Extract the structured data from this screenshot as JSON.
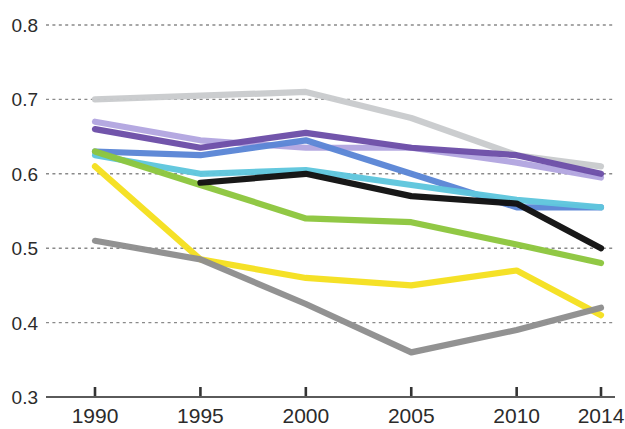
{
  "chart_data": {
    "type": "line",
    "title": "",
    "subtitle": "",
    "xlabel": "",
    "ylabel": "",
    "x": [
      1990,
      1995,
      2000,
      2005,
      2010,
      2014
    ],
    "xtick_labels": [
      "1990",
      "1995",
      "2000",
      "2005",
      "2010",
      "2014"
    ],
    "ytick_labels": [
      "0.3",
      "0.4",
      "0.5",
      "0.6",
      "0.7",
      "0.8"
    ],
    "ytick_values": [
      0.3,
      0.4,
      0.5,
      0.6,
      0.7,
      0.8
    ],
    "xlim": [
      1988.5,
      2015.5
    ],
    "ylim": [
      0.3,
      0.8
    ],
    "grid": true,
    "grid_axis": "y",
    "grid_style": "dotted",
    "legend": false,
    "legend_position": "none",
    "annotations": [],
    "series": [
      {
        "name": "light-gray-series",
        "color": "#c9cbcd",
        "x": [
          1990,
          1995,
          2000,
          2005,
          2010,
          2014
        ],
        "values": [
          0.7,
          0.705,
          0.71,
          0.675,
          0.625,
          0.61
        ]
      },
      {
        "name": "lavender-series",
        "color": "#b3a6e0",
        "x": [
          1990,
          1995,
          2000,
          2005,
          2010,
          2014
        ],
        "values": [
          0.67,
          0.645,
          0.635,
          0.635,
          0.615,
          0.595
        ]
      },
      {
        "name": "purple-series",
        "color": "#6d4fa8",
        "x": [
          1990,
          1995,
          2000,
          2005,
          2010,
          2014
        ],
        "values": [
          0.66,
          0.635,
          0.655,
          0.635,
          0.625,
          0.6
        ]
      },
      {
        "name": "blue-series",
        "color": "#5b86d6",
        "x": [
          1990,
          1995,
          2000,
          2005,
          2010,
          2014
        ],
        "values": [
          0.63,
          0.625,
          0.645,
          0.6,
          0.555,
          0.555
        ]
      },
      {
        "name": "cyan-series",
        "color": "#5fc6dd",
        "x": [
          1990,
          1995,
          2000,
          2005,
          2010,
          2014
        ],
        "values": [
          0.625,
          0.6,
          0.605,
          0.585,
          0.565,
          0.555
        ]
      },
      {
        "name": "green-series",
        "color": "#8dc63f",
        "x": [
          1990,
          1995,
          2000,
          2005,
          2010,
          2014
        ],
        "values": [
          0.63,
          0.585,
          0.54,
          0.535,
          0.505,
          0.48
        ]
      },
      {
        "name": "black-series",
        "color": "#111111",
        "x": [
          1995,
          2000,
          2005,
          2010,
          2014
        ],
        "values": [
          0.588,
          0.6,
          0.57,
          0.56,
          0.5
        ]
      },
      {
        "name": "yellow-series",
        "color": "#f5e020",
        "x": [
          1990,
          1995,
          2000,
          2005,
          2010,
          2014
        ],
        "values": [
          0.61,
          0.485,
          0.46,
          0.45,
          0.47,
          0.41
        ]
      },
      {
        "name": "dark-gray-series",
        "color": "#8e8e8e",
        "x": [
          1990,
          1995,
          2000,
          2005,
          2010,
          2014
        ],
        "values": [
          0.51,
          0.485,
          0.425,
          0.36,
          0.39,
          0.42
        ]
      }
    ]
  },
  "axes": {
    "y_axis_name": "value-axis",
    "x_axis_name": "year-axis"
  }
}
